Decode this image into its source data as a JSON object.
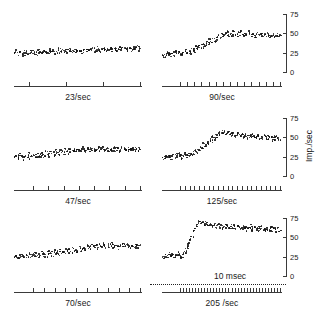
{
  "figure": {
    "axis_title": "Imp./sec",
    "calibration": {
      "label": "10 msec"
    }
  },
  "chart_data": {
    "type": "scatter",
    "title": "",
    "xlabel": "",
    "ylabel": "Imp./sec",
    "ylim": [
      0,
      75
    ],
    "yticks": [
      0,
      25,
      50,
      75
    ],
    "ytick_labels": [
      "0",
      "25",
      "50",
      "75"
    ],
    "grid": false,
    "legend": null,
    "x_calibration": "10 msec",
    "panels": [
      {
        "label": "23/sec",
        "row": 0,
        "col": 0,
        "n_ticks": 4,
        "baseline": 26,
        "plateau": 30,
        "peak": 32,
        "rise_fraction": 0.55,
        "scatter": 4.5,
        "values": [
          25,
          27,
          24,
          26,
          28,
          25,
          23,
          27,
          26,
          24,
          28,
          25,
          27,
          26,
          24,
          29,
          26,
          25,
          28,
          27,
          26,
          24,
          27,
          29,
          26,
          28,
          25,
          27,
          30,
          26,
          28,
          27,
          29,
          26,
          28,
          30,
          27,
          29,
          28,
          26,
          30,
          28,
          29,
          27,
          31,
          29,
          28,
          30,
          29,
          31,
          28,
          30,
          29,
          32,
          30,
          29,
          31,
          30,
          28,
          31,
          30,
          32,
          29,
          31,
          30,
          29,
          32,
          31,
          30,
          33,
          31,
          30,
          32,
          31,
          29,
          32,
          31,
          33,
          30,
          32
        ]
      },
      {
        "label": "90/sec",
        "row": 0,
        "col": 1,
        "n_ticks": 15,
        "baseline": 25,
        "plateau": 49,
        "peak": 52,
        "rise_fraction": 0.42,
        "scatter": 4.0,
        "values": [
          24,
          22,
          25,
          23,
          26,
          24,
          22,
          25,
          23,
          26,
          24,
          27,
          25,
          23,
          26,
          28,
          25,
          27,
          29,
          26,
          30,
          28,
          31,
          33,
          30,
          34,
          36,
          33,
          38,
          35,
          40,
          37,
          42,
          39,
          44,
          41,
          46,
          43,
          48,
          45,
          50,
          47,
          51,
          49,
          52,
          48,
          51,
          49,
          52,
          50,
          48,
          51,
          49,
          52,
          50,
          47,
          51,
          49,
          52,
          50,
          48,
          51,
          49,
          47,
          50,
          48,
          51,
          49,
          47,
          50,
          48,
          51,
          49,
          47,
          50,
          48,
          46,
          49,
          47,
          50
        ]
      },
      {
        "label": "47/sec",
        "row": 1,
        "col": 0,
        "n_ticks": 8,
        "baseline": 26,
        "plateau": 34,
        "peak": 37,
        "rise_fraction": 0.5,
        "scatter": 4.2,
        "values": [
          25,
          27,
          24,
          26,
          28,
          25,
          23,
          27,
          26,
          29,
          25,
          28,
          26,
          24,
          29,
          27,
          25,
          30,
          28,
          26,
          31,
          29,
          27,
          32,
          30,
          28,
          33,
          31,
          29,
          34,
          32,
          30,
          35,
          33,
          31,
          36,
          34,
          32,
          35,
          33,
          36,
          34,
          32,
          37,
          35,
          33,
          36,
          34,
          37,
          35,
          33,
          36,
          34,
          37,
          35,
          38,
          36,
          34,
          37,
          35,
          33,
          36,
          34,
          37,
          35,
          38,
          36,
          34,
          37,
          35,
          36,
          34,
          37,
          35,
          33,
          36,
          34,
          37,
          35,
          36
        ]
      },
      {
        "label": "125/sec",
        "row": 1,
        "col": 1,
        "n_ticks": 22,
        "baseline": 27,
        "plateau": 52,
        "peak": 58,
        "rise_fraction": 0.4,
        "scatter": 4.0,
        "values": [
          26,
          24,
          27,
          25,
          28,
          26,
          24,
          27,
          25,
          28,
          26,
          29,
          27,
          25,
          28,
          30,
          27,
          29,
          26,
          28,
          31,
          29,
          33,
          31,
          36,
          34,
          39,
          37,
          42,
          40,
          45,
          43,
          48,
          46,
          51,
          49,
          54,
          52,
          57,
          55,
          58,
          56,
          57,
          55,
          58,
          56,
          54,
          57,
          55,
          53,
          56,
          54,
          52,
          55,
          53,
          51,
          54,
          52,
          50,
          53,
          51,
          54,
          52,
          50,
          53,
          51,
          49,
          52,
          50,
          53,
          51,
          49,
          52,
          50,
          48,
          51,
          49,
          52,
          50,
          48
        ]
      },
      {
        "label": "70/sec",
        "row": 2,
        "col": 0,
        "n_ticks": 11,
        "baseline": 26,
        "plateau": 40,
        "peak": 43,
        "rise_fraction": 0.52,
        "scatter": 4.2,
        "values": [
          25,
          27,
          24,
          26,
          28,
          25,
          23,
          27,
          26,
          29,
          25,
          28,
          26,
          30,
          27,
          29,
          26,
          31,
          28,
          30,
          27,
          32,
          29,
          31,
          28,
          33,
          30,
          32,
          29,
          34,
          31,
          33,
          30,
          35,
          32,
          34,
          31,
          36,
          33,
          35,
          32,
          37,
          34,
          36,
          38,
          35,
          40,
          37,
          39,
          41,
          38,
          42,
          40,
          37,
          41,
          39,
          42,
          40,
          38,
          41,
          39,
          42,
          40,
          38,
          41,
          39,
          37,
          40,
          38,
          41,
          39,
          42,
          40,
          38,
          41,
          39,
          37,
          40,
          38,
          41
        ]
      },
      {
        "label": "205 /sec",
        "row": 2,
        "col": 1,
        "n_ticks": 34,
        "baseline": 28,
        "plateau": 64,
        "peak": 72,
        "rise_fraction": 0.3,
        "scatter": 4.5,
        "values": [
          27,
          25,
          28,
          26,
          29,
          27,
          25,
          28,
          26,
          29,
          27,
          30,
          28,
          26,
          29,
          31,
          34,
          38,
          43,
          48,
          53,
          58,
          63,
          67,
          70,
          72,
          71,
          69,
          67,
          70,
          68,
          66,
          69,
          67,
          65,
          68,
          66,
          64,
          67,
          65,
          63,
          66,
          64,
          67,
          65,
          63,
          66,
          64,
          62,
          65,
          63,
          66,
          64,
          62,
          65,
          63,
          61,
          64,
          62,
          65,
          63,
          61,
          64,
          62,
          60,
          63,
          61,
          64,
          62,
          60,
          63,
          61,
          59,
          62,
          60,
          63,
          61,
          59,
          62,
          60
        ]
      }
    ]
  }
}
